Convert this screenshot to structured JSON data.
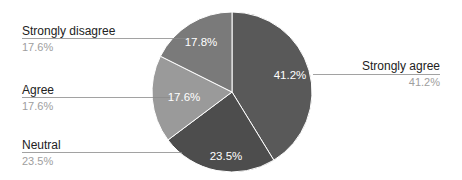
{
  "chart_data": {
    "type": "pie",
    "title": "",
    "categories": [
      "Strongly agree",
      "Neutral",
      "Agree",
      "Strongly disagree"
    ],
    "values": [
      41.2,
      23.5,
      17.6,
      17.6
    ],
    "value_labels": [
      "41.2%",
      "23.5%",
      "17.6%",
      "17.6%"
    ],
    "colors": [
      "#595959",
      "#4d4d4d",
      "#9a9a9a",
      "#7a7a7a"
    ],
    "start_angle_deg": 0,
    "direction": "clockwise",
    "legend": "callout labels"
  },
  "slices": [
    {
      "name": "Strongly agree",
      "pct": "41.2%",
      "inner": "41.2%"
    },
    {
      "name": "Neutral",
      "pct": "23.5%",
      "inner": "23.5%"
    },
    {
      "name": "Agree",
      "pct": "17.6%",
      "inner": "17.6%"
    },
    {
      "name": "Strongly disagree",
      "pct": "17.6%",
      "inner": "17.8%"
    }
  ]
}
